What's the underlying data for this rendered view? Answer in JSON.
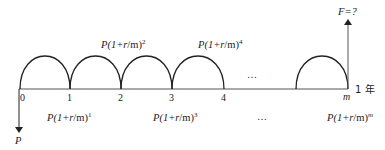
{
  "diagram": {
    "type": "cash-flow-timeline",
    "ticks": [
      {
        "label": "0",
        "x": 20
      },
      {
        "label": "1",
        "x": 70
      },
      {
        "label": "2",
        "x": 121
      },
      {
        "label": "3",
        "x": 172
      },
      {
        "label": "4",
        "x": 224
      },
      {
        "label": "m",
        "x": 348
      }
    ],
    "axis_end_label": "1 年",
    "ellipsis_top": "…",
    "ellipsis_bottom": "…",
    "present_value": {
      "label": "P"
    },
    "future_value": {
      "label": "F=?"
    },
    "upper_formulas": [
      {
        "base": "P(1+",
        "var": "r",
        "rest": "/m)",
        "exp": "2"
      },
      {
        "base": "P(1+",
        "var": "r",
        "rest": "/m)",
        "exp": "4"
      }
    ],
    "lower_formulas": [
      {
        "base": "P(1+",
        "var": "r",
        "rest": "/m)",
        "exp": "1"
      },
      {
        "base": "P(1+",
        "var": "r",
        "rest": "/m)",
        "exp": "3"
      },
      {
        "base": "P(1+",
        "var": "r",
        "rest": "/m)",
        "exp": "m"
      }
    ],
    "colors": {
      "line": "#222222",
      "axis": "#555555",
      "text": "#222222"
    }
  }
}
